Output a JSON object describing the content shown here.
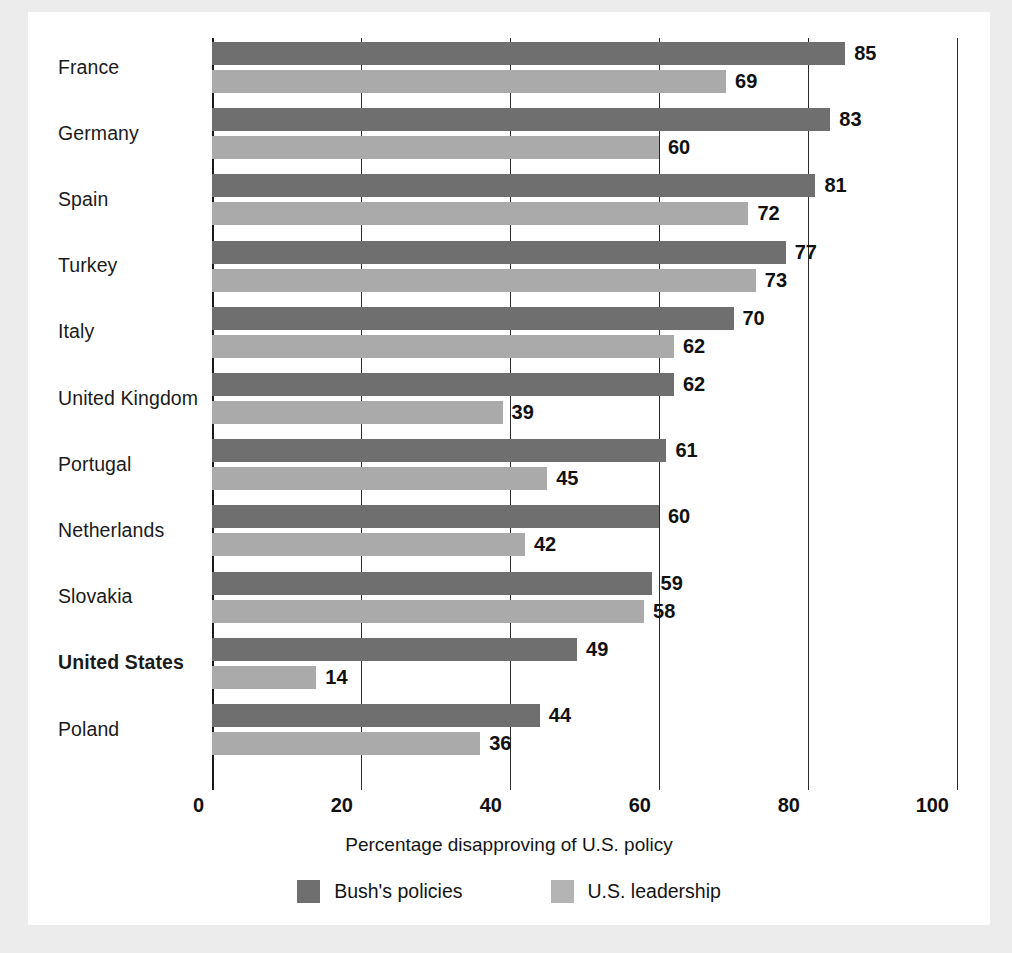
{
  "chart_data": {
    "type": "bar",
    "orientation": "horizontal",
    "title": "",
    "xlabel": "Percentage disapproving of U.S. policy",
    "ylabel": "",
    "xlim": [
      0,
      100
    ],
    "xticks": [
      0,
      20,
      40,
      60,
      80,
      100
    ],
    "xtick_labels": [
      "0",
      "20",
      "40",
      "60",
      "80",
      "100"
    ],
    "grid": true,
    "legend_position": "bottom",
    "categories": [
      "France",
      "Germany",
      "Spain",
      "Turkey",
      "Italy",
      "United Kingdom",
      "Portugal",
      "Netherlands",
      "Slovakia",
      "United States",
      "Poland"
    ],
    "highlighted_categories": [
      "United States"
    ],
    "series": [
      {
        "name": "Bush's policies",
        "color": "#6f6f6f",
        "values": [
          85,
          83,
          81,
          77,
          70,
          62,
          61,
          60,
          59,
          49,
          44
        ]
      },
      {
        "name": "U.S. leadership",
        "color": "#aaaaaa",
        "values": [
          69,
          60,
          72,
          73,
          62,
          39,
          45,
          42,
          58,
          14,
          36
        ]
      }
    ]
  },
  "legend": {
    "items": [
      {
        "label": "Bush's policies",
        "swatch": "dark"
      },
      {
        "label": "U.S. leadership",
        "swatch": "light"
      }
    ]
  },
  "colors": {
    "page_background": "#ececec",
    "card_background": "#ffffff",
    "bar_dark": "#6f6f6f",
    "bar_light": "#aaaaaa",
    "axis": "#1a1a1a",
    "text": "#111111"
  }
}
